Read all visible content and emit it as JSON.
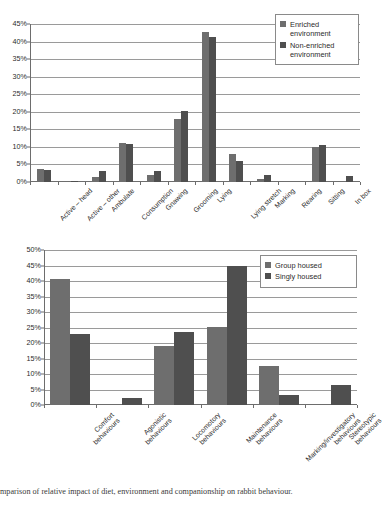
{
  "caption": "mparison of relative impact of diet, environment and companionship on rabbit behaviour.",
  "colors": {
    "series_1": "#6e6e6e",
    "series_2": "#4f4f4f",
    "grid": "#9a9a9a",
    "axis": "#6d6d6d"
  },
  "chart_data": [
    {
      "id": "top",
      "type": "bar",
      "title": "",
      "xlabel": "",
      "ylabel": "",
      "ylim": [
        0,
        45
      ],
      "ytick_step": 5,
      "yticks": [
        "0%",
        "5%",
        "10%",
        "15%",
        "20%",
        "25%",
        "30%",
        "35%",
        "40%",
        "45%"
      ],
      "grid": true,
      "legend_position": "top-right",
      "categories": [
        "Active – head",
        "Active – other",
        "Ambulate",
        "Consumption",
        "Gnawing",
        "Grooming",
        "Lying",
        "Lying stretch",
        "Marking",
        "Rearing",
        "Sitting",
        "In box"
      ],
      "series": [
        {
          "name": "Enriched environment",
          "values": [
            3.6,
            0.0,
            1.3,
            11.1,
            2.0,
            18.0,
            42.8,
            8.0,
            1.0,
            0.2,
            10.0,
            0.0
          ]
        },
        {
          "name": "Non-enriched environment",
          "values": [
            3.4,
            0.3,
            3.0,
            10.9,
            3.0,
            20.2,
            41.2,
            6.0,
            2.0,
            0.0,
            10.6,
            1.8
          ]
        }
      ]
    },
    {
      "id": "bottom",
      "type": "bar",
      "title": "",
      "xlabel": "",
      "ylabel": "",
      "ylim": [
        0,
        50
      ],
      "ytick_step": 5,
      "yticks": [
        "0%",
        "5%",
        "10%",
        "15%",
        "20%",
        "25%",
        "30%",
        "35%",
        "40%",
        "45%",
        "50%"
      ],
      "grid": true,
      "legend_position": "top-right",
      "categories": [
        "Comfort behaviours",
        "Agonistic behaviours",
        "Locomotory behaviours",
        "Maintenance behaviours",
        "Marking/investigatory behaviours",
        "Stereotypic behaviours"
      ],
      "series": [
        {
          "name": "Group housed",
          "values": [
            40.5,
            0.0,
            19.0,
            25.3,
            12.6,
            0.0
          ]
        },
        {
          "name": "Singly housed",
          "values": [
            22.9,
            2.4,
            23.4,
            44.7,
            3.3,
            6.3
          ]
        }
      ]
    }
  ]
}
